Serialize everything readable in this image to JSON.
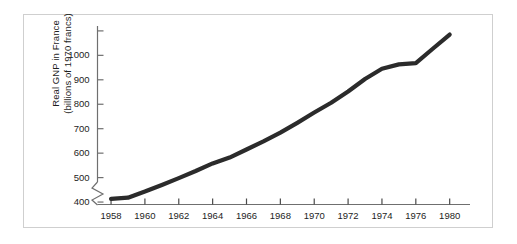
{
  "figure": {
    "background_color": "#ffffff",
    "frame_color": "#cfcfcf",
    "line_color": "#2b2b2b",
    "axis_color": "#6f6f6f",
    "text_color": "#1d1d1d"
  },
  "chart_data": {
    "type": "line",
    "title": "",
    "subtitle": "",
    "xlabel": "",
    "ylabel": "Real GNP in France (billions of 1970 francs)",
    "ylabel_line1": "Real GNP in France",
    "ylabel_line2": "(billions of 1970 francs)",
    "grid": false,
    "legend": null,
    "axis_break": {
      "present": true,
      "axis": "y",
      "below_value": 400,
      "symbol": "zigzag"
    },
    "xlim": [
      1957.2,
      1979.2
    ],
    "ylim": [
      390,
      1120
    ],
    "yticks": [
      400,
      500,
      600,
      700,
      800,
      900,
      1000
    ],
    "ytick_labels": [
      "400",
      "500",
      "600",
      "700",
      "800",
      "900",
      "1000"
    ],
    "ytick_extra_unlabeled": [
      1100
    ],
    "xticks": [
      1958,
      1960,
      1962,
      1964,
      1966,
      1968,
      1970,
      1972,
      1974,
      1976,
      1980
    ],
    "xtick_labels": [
      "1958",
      "1960",
      "1962",
      "1964",
      "1966",
      "1968",
      "1970",
      "1972",
      "1974",
      "1976",
      "1980"
    ],
    "x": [
      1958,
      1959,
      1960,
      1961,
      1962,
      1963,
      1964,
      1965,
      1966,
      1967,
      1968,
      1969,
      1970,
      1971,
      1972,
      1973,
      1974,
      1975,
      1976,
      1977,
      1978
    ],
    "values": [
      413,
      418,
      443,
      470,
      498,
      527,
      558,
      582,
      615,
      648,
      684,
      724,
      766,
      806,
      852,
      903,
      945,
      963,
      968,
      1027,
      1085
    ],
    "series": [
      {
        "name": "Real GNP in France",
        "values": [
          413,
          418,
          443,
          470,
          498,
          527,
          558,
          582,
          615,
          648,
          684,
          724,
          766,
          806,
          852,
          903,
          945,
          963,
          968,
          1027,
          1085
        ]
      }
    ]
  }
}
